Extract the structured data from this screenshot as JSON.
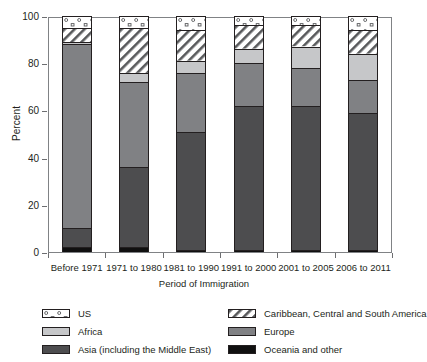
{
  "chart_data": {
    "type": "bar",
    "subtype": "stacked-percent",
    "title": "",
    "xlabel": "Period of Immigration",
    "ylabel": "Percent",
    "ylim": [
      0,
      100
    ],
    "yticks": [
      0,
      20,
      40,
      60,
      80,
      100
    ],
    "ytick_labels": [
      "0",
      "20",
      "40",
      "60",
      "80",
      "100"
    ],
    "grid": false,
    "legend_position": "bottom",
    "categories": [
      "Before 1971",
      "1971 to 1980",
      "1981 to 1990",
      "1991 to 2000",
      "2001 to 2005",
      "2006 to 2011"
    ],
    "series": [
      {
        "name": "Oceania and other",
        "key": "oceania",
        "color": "#101010",
        "pattern": "solid",
        "values": [
          2,
          2,
          1,
          1,
          1,
          1
        ]
      },
      {
        "name": "Asia (including the Middle East)",
        "key": "asia",
        "color": "#4d4d4f",
        "pattern": "solid",
        "values": [
          8,
          34,
          50,
          61,
          61,
          58
        ]
      },
      {
        "name": "Europe",
        "key": "europe",
        "color": "#808184",
        "pattern": "solid",
        "values": [
          78,
          36,
          25,
          18,
          16,
          14
        ]
      },
      {
        "name": "Africa",
        "key": "africa",
        "color": "#c6c7c9",
        "pattern": "solid",
        "values": [
          1,
          4,
          5,
          6,
          9,
          11
        ]
      },
      {
        "name": "Caribbean, Central and South America",
        "key": "caribbean",
        "color": "#ffffff",
        "pattern": "diagonal-hatch",
        "values": [
          6,
          19,
          13,
          10,
          9,
          10
        ]
      },
      {
        "name": "US",
        "key": "us",
        "color": "#ffffff",
        "pattern": "dots",
        "values": [
          5,
          5,
          6,
          4,
          4,
          6
        ]
      }
    ]
  },
  "axes": {
    "y_title": "Percent",
    "x_title": "Period of Immigration"
  },
  "legend": {
    "items": [
      {
        "label": "US",
        "key": "us"
      },
      {
        "label": "Caribbean, Central and South America",
        "key": "caribbean"
      },
      {
        "label": "Africa",
        "key": "africa"
      },
      {
        "label": "Europe",
        "key": "europe"
      },
      {
        "label": "Asia (including the Middle East)",
        "key": "asia"
      },
      {
        "label": "Oceania and other",
        "key": "oceania"
      }
    ]
  }
}
